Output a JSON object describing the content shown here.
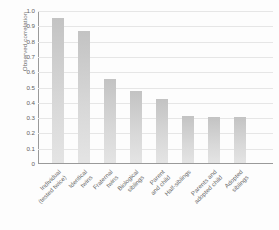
{
  "chart_data": {
    "type": "bar",
    "title": "",
    "xlabel": "",
    "ylabel": "Observed correlation",
    "ylim": [
      0,
      1.0
    ],
    "grid": true,
    "legend": "none",
    "ytick_labels": [
      "1.0",
      "0.9",
      "0.8",
      "0.7",
      "0.6",
      "0.5",
      "0.4",
      "0.3",
      "0.2",
      "0.1",
      "0"
    ],
    "ytick_values": [
      1.0,
      0.9,
      0.8,
      0.7,
      0.6,
      0.5,
      0.4,
      0.3,
      0.2,
      0.1,
      0
    ],
    "categories": [
      "Individual (tested twice)",
      "Identical twins",
      "Fraternal twins",
      "Biological siblings",
      "Parent and child",
      "Half-siblings",
      "Parents and adopted child",
      "Adopted siblings"
    ],
    "category_lines": [
      [
        "Individual",
        "(tested twice)"
      ],
      [
        "Identical",
        "twins"
      ],
      [
        "Fraternal",
        "twins"
      ],
      [
        "Biological",
        "siblings"
      ],
      [
        "Parent",
        "and child"
      ],
      [
        "Half-siblings",
        ""
      ],
      [
        "Parents and",
        "adopted child"
      ],
      [
        "Adopted",
        "siblings"
      ]
    ],
    "values": [
      0.95,
      0.86,
      0.55,
      0.47,
      0.42,
      0.31,
      0.3,
      0.3
    ],
    "colors": {
      "bar_top": "#c3c3c3",
      "bar_bottom": "#e4e4e4",
      "gridline": "#e6e6e6",
      "axis": "#9a9a9a",
      "text": "#6a6a6a",
      "background": "#fdfdfd"
    }
  }
}
